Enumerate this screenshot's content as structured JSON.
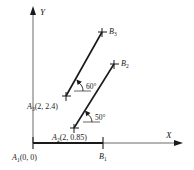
{
  "figure": {
    "axes": {
      "x_label": "X",
      "y_label": "Y"
    },
    "points": [
      {
        "id": "A1",
        "name": "A",
        "sub": "1",
        "coords": "(0, 0)",
        "label": "A₁ (0, 0)"
      },
      {
        "id": "A2",
        "name": "A",
        "sub": "2",
        "coords": "(2, 0.85)",
        "label": "A₂ (2, 0.85)"
      },
      {
        "id": "A3",
        "name": "A",
        "sub": "3",
        "coords": "(2, 2.4)",
        "label": "A₃ (2, 2.4)"
      },
      {
        "id": "B1",
        "name": "B",
        "sub": "1",
        "coords": "",
        "label": "B₁"
      },
      {
        "id": "B2",
        "name": "B",
        "sub": "2",
        "coords": "",
        "label": "B₂"
      },
      {
        "id": "B3",
        "name": "B",
        "sub": "3",
        "coords": "",
        "label": "B₃"
      }
    ],
    "angles": [
      {
        "id": "angle-upper",
        "value": "60",
        "unit": "°",
        "label": "60°",
        "belongs_to": "A3-B3"
      },
      {
        "id": "angle-lower",
        "value": "50",
        "unit": "°",
        "label": "50°",
        "belongs_to": "A2-B2"
      }
    ],
    "segments": [
      {
        "id": "A1-B1",
        "from": "A1",
        "to": "B1",
        "style": "thick-baseline"
      },
      {
        "id": "A2-B2",
        "from": "A2",
        "to": "B2",
        "style": "inclined"
      },
      {
        "id": "A3-B3",
        "from": "A3",
        "to": "B3",
        "style": "inclined"
      }
    ],
    "colors": {
      "ink": "#1a1a1a",
      "axis": "#6b6b6b",
      "background": "#ffffff"
    }
  }
}
